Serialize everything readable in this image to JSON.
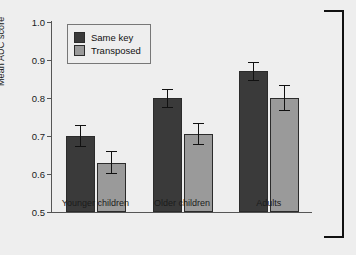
{
  "chart_data": {
    "type": "bar",
    "title": "",
    "xlabel": "",
    "ylabel": "Mean AUC score",
    "ylim": [
      0.5,
      1.0
    ],
    "yticks": [
      "1.0",
      "0.9",
      "0.8",
      "0.7",
      "0.6",
      "0.5"
    ],
    "ytick_values": [
      1.0,
      0.9,
      0.8,
      0.7,
      0.6,
      0.5
    ],
    "grid": false,
    "legend_position": "upper-left-inside",
    "categories": [
      "Younger children",
      "Older children",
      "Adults"
    ],
    "series": [
      {
        "name": "Same key",
        "color": "#3a3a3a",
        "values": [
          0.7,
          0.8,
          0.87
        ],
        "errors": [
          0.03,
          0.025,
          0.025
        ]
      },
      {
        "name": "Transposed",
        "color": "#9a9a9a",
        "values": [
          0.63,
          0.705,
          0.8
        ],
        "errors": [
          0.03,
          0.03,
          0.035
        ]
      }
    ]
  },
  "figure": {
    "background_color": "#eeeeee",
    "axis_color": "#555555",
    "panel_bracket": "panel-bracket"
  }
}
